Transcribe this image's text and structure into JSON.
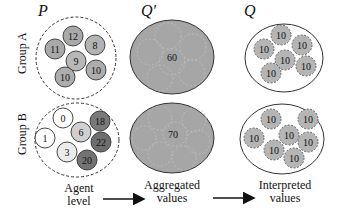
{
  "headers": {
    "p": "P",
    "q_prime": "Q′",
    "q": "Q"
  },
  "groups": {
    "a": {
      "label": "Group A"
    },
    "b": {
      "label": "Group B"
    }
  },
  "agent_level": {
    "group_a": [
      {
        "value": "12",
        "cx": 73,
        "cy": 36,
        "fill": "#a9a9a9"
      },
      {
        "value": "11",
        "cx": 55,
        "cy": 49,
        "fill": "#a9a9a9"
      },
      {
        "value": "8",
        "cx": 95,
        "cy": 45,
        "fill": "#b3b3b3"
      },
      {
        "value": "9",
        "cx": 76,
        "cy": 61,
        "fill": "#b8b8b8"
      },
      {
        "value": "10",
        "cx": 65,
        "cy": 77,
        "fill": "#adadad"
      },
      {
        "value": "10",
        "cx": 96,
        "cy": 70,
        "fill": "#adadad"
      }
    ],
    "group_b": [
      {
        "value": "0",
        "cx": 63,
        "cy": 118,
        "fill": "#ffffff"
      },
      {
        "value": "1",
        "cx": 45,
        "cy": 138,
        "fill": "#ffffff"
      },
      {
        "value": "6",
        "cx": 81,
        "cy": 132,
        "fill": "#d0d0d0"
      },
      {
        "value": "3",
        "cx": 67,
        "cy": 152,
        "fill": "#ebebeb"
      },
      {
        "value": "18",
        "cx": 100,
        "cy": 121,
        "fill": "#7a7a7a"
      },
      {
        "value": "22",
        "cx": 101,
        "cy": 142,
        "fill": "#6e6e6e"
      },
      {
        "value": "20",
        "cx": 87,
        "cy": 160,
        "fill": "#737373"
      }
    ]
  },
  "aggregated": {
    "group_a": {
      "value": "60"
    },
    "group_b": {
      "value": "70"
    }
  },
  "interpreted": {
    "group_a": [
      {
        "value": "10",
        "cx": 281,
        "cy": 35
      },
      {
        "value": "10",
        "cx": 264,
        "cy": 49
      },
      {
        "value": "10",
        "cx": 302,
        "cy": 45
      },
      {
        "value": "10",
        "cx": 285,
        "cy": 60
      },
      {
        "value": "10",
        "cx": 306,
        "cy": 66
      },
      {
        "value": "10",
        "cx": 271,
        "cy": 73
      }
    ],
    "group_b": [
      {
        "value": "10",
        "cx": 271,
        "cy": 119
      },
      {
        "value": "10",
        "cx": 308,
        "cy": 119
      },
      {
        "value": "10",
        "cx": 254,
        "cy": 138
      },
      {
        "value": "10",
        "cx": 289,
        "cy": 135
      },
      {
        "value": "10",
        "cx": 308,
        "cy": 142
      },
      {
        "value": "10",
        "cx": 274,
        "cy": 150
      },
      {
        "value": "10",
        "cx": 294,
        "cy": 158
      }
    ]
  },
  "stages": {
    "agent": {
      "line1": "Agent",
      "line2": "level"
    },
    "aggregated": {
      "line1": "Aggregated",
      "line2": "values"
    },
    "interpreted": {
      "line1": "Interpreted",
      "line2": "values"
    }
  },
  "colors": {
    "aggregate_fill": "#a6a6a6",
    "interpreted_fill": "#b5b5b5",
    "stroke": "#333333"
  }
}
